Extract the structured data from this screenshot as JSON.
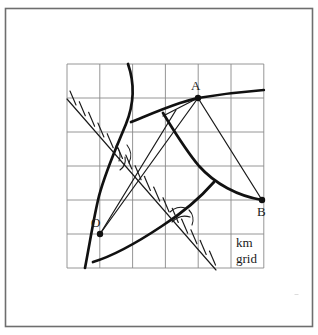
{
  "figure": {
    "caption_lines": [
      "km",
      "grid"
    ],
    "colors": {
      "ink": "#1a1a1a",
      "grid": "#8a8a8a",
      "border": "#6e6e6e",
      "paper": "#ffffff"
    },
    "border": {
      "x": 5,
      "y": 8,
      "width": 308,
      "height": 319
    },
    "grid": {
      "x": 67,
      "y": 64,
      "width": 197,
      "height": 204,
      "columns": 6,
      "rows": 6,
      "cell_width": 32.8,
      "cell_height": 34.0,
      "x_lines": [
        67,
        99.8,
        132.6,
        165.4,
        198.2,
        231.0,
        263.8
      ],
      "y_lines": [
        64,
        98,
        132,
        166,
        200,
        234,
        268
      ],
      "units": "km"
    },
    "points": [
      {
        "id": "O",
        "label": "O",
        "x": 100,
        "y": 234,
        "label_x": 91,
        "label_y": 227,
        "marker": "dot"
      },
      {
        "id": "A",
        "label": "A",
        "x": 198,
        "y": 98,
        "label_x": 191,
        "label_y": 90,
        "marker": "dot"
      },
      {
        "id": "B",
        "label": "B",
        "x": 262,
        "y": 200,
        "label_x": 259,
        "label_y": 216,
        "marker": "dot"
      }
    ],
    "straight_lines": [
      {
        "name": "line-O-A",
        "from": "O",
        "to": "A",
        "x1": 100,
        "y1": 234,
        "x2": 198,
        "y2": 98,
        "weight": "thin"
      },
      {
        "name": "line-A-B",
        "from": "A",
        "to": "B",
        "x1": 198,
        "y1": 98,
        "x2": 262,
        "y2": 200,
        "weight": "thin"
      },
      {
        "name": "line-O-ray",
        "from": "O",
        "to": "lower-right",
        "x1": 100,
        "y1": 234,
        "x2": 175,
        "y2": 118,
        "weight": "thin"
      },
      {
        "name": "line-A-spur",
        "from": "A",
        "to": "left-arc",
        "x1": 198,
        "y1": 98,
        "x2": 163,
        "y2": 115,
        "weight": "thin"
      }
    ],
    "thick_curves": [
      {
        "name": "curve-left-vertical",
        "description": "steep curve descending from top edge through left of grid to bottom-left"
      },
      {
        "name": "curve-through-A",
        "description": "broad arc sweeping from left mid-grid up through A and out the right edge"
      },
      {
        "name": "curve-A-to-B",
        "description": "arc from near A curving down and right to B"
      },
      {
        "name": "curve-lower-right",
        "description": "arc rising from lower-left of O toward mid-right edge"
      }
    ],
    "hatched_line": {
      "name": "hatched-bearing-line",
      "description": "tick-marked (hatched) straight line running from upper-left to lower-right across the grid",
      "x1": 67,
      "y1": 99,
      "x2": 216,
      "y2": 270,
      "tick_count": 16,
      "tick_length": 9
    },
    "angle_marks": [
      {
        "name": "angle-mark-upper",
        "x": 123,
        "y": 152
      },
      {
        "name": "angle-mark-lower",
        "x": 178,
        "y": 214
      }
    ],
    "caption": {
      "x": 236,
      "y": 244,
      "line1": "km",
      "line2": "grid"
    }
  }
}
